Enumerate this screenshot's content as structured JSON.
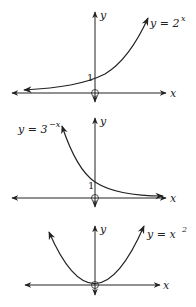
{
  "graphs": [
    {
      "name": "exponential-growth",
      "equation_base": "y = 2",
      "equation_exp": "x",
      "x_label": "x",
      "y_label": "y",
      "intercept_label": "1"
    },
    {
      "name": "exponential-decay",
      "equation_base": "y = 3",
      "equation_exp": "−x",
      "x_label": "x",
      "y_label": "y",
      "intercept_label": "1"
    },
    {
      "name": "parabola",
      "equation_base": "y = x",
      "equation_exp": "2",
      "x_label": "x",
      "y_label": "y"
    }
  ],
  "colors": {
    "ink": "#222222",
    "background": "#ffffff"
  }
}
